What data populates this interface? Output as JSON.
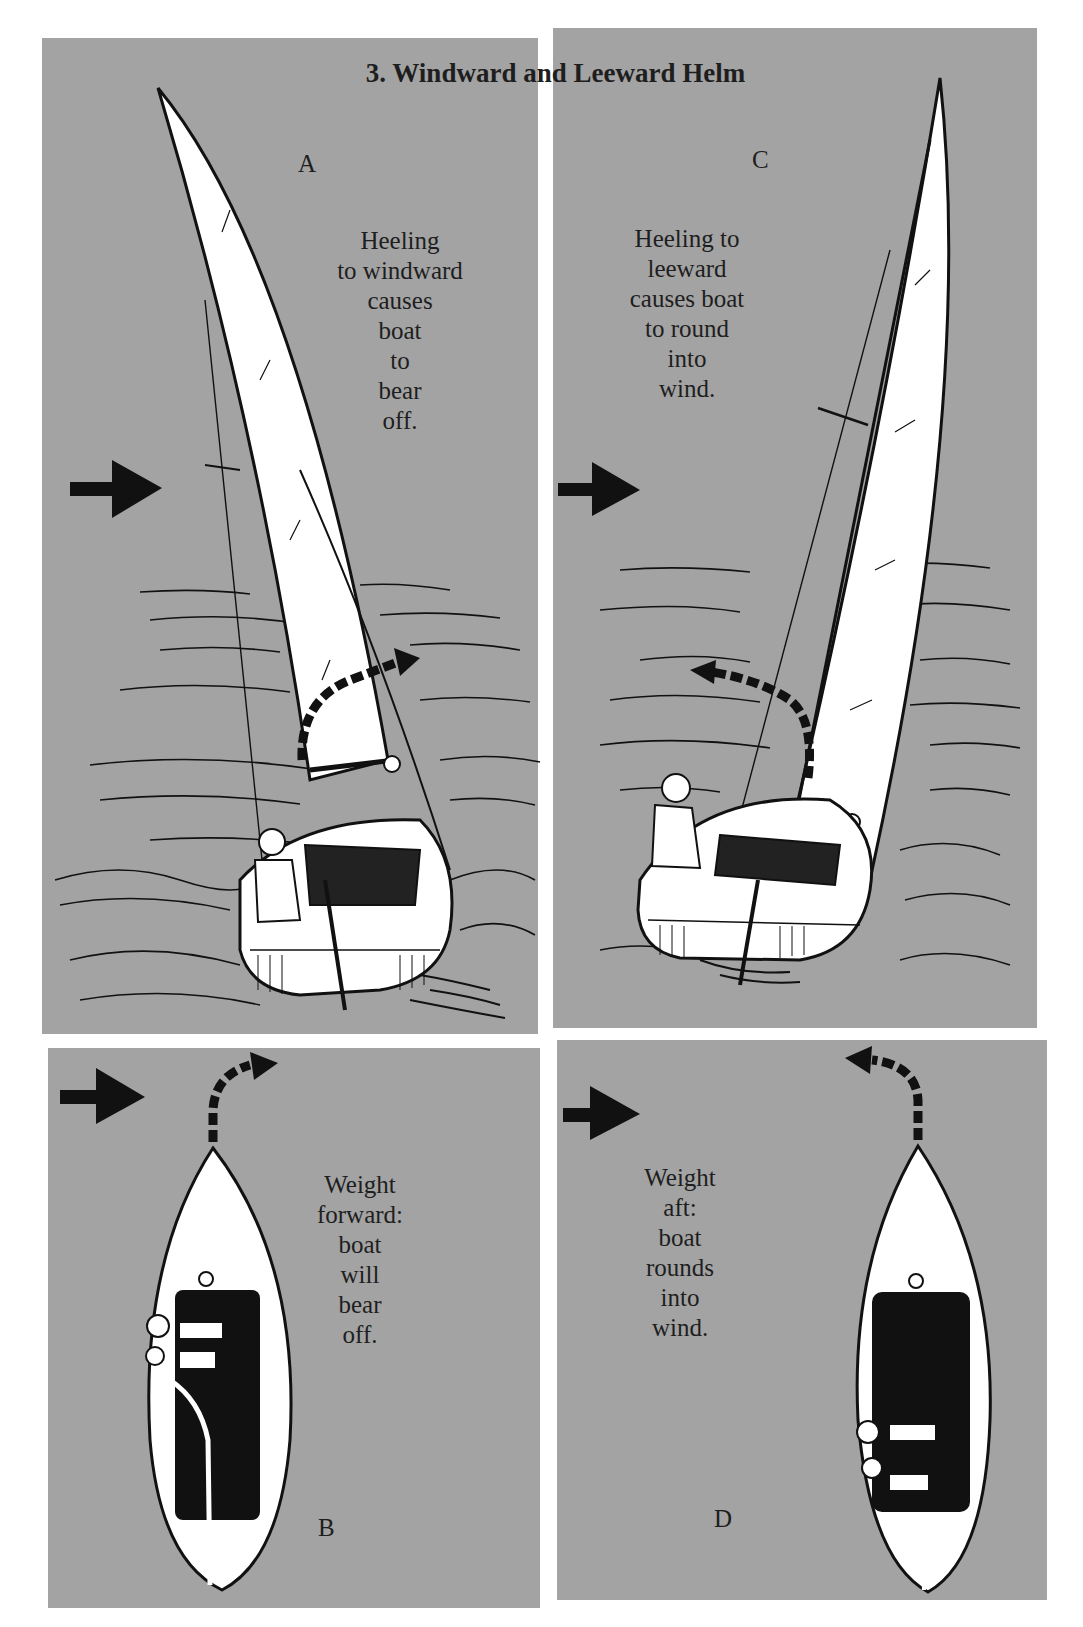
{
  "figure": {
    "title": "3.  Windward and Leeward Helm",
    "colors": {
      "panel_background": "#a3a3a3",
      "page_background": "#ffffff",
      "ink": "#111111",
      "sail": "#ffffff"
    },
    "panels": {
      "a": {
        "label": "A",
        "caption_lines": [
          "Heeling",
          "to windward",
          "causes",
          "boat",
          "to",
          "bear",
          "off."
        ],
        "wind_arrow": "right",
        "turn_arrow": "right"
      },
      "c": {
        "label": "C",
        "caption_lines": [
          "Heeling to",
          "leeward",
          "causes boat",
          "to round",
          "into",
          "wind."
        ],
        "wind_arrow": "right",
        "turn_arrow": "left"
      },
      "b": {
        "label": "B",
        "caption_lines": [
          "Weight",
          "forward:",
          "boat",
          "will",
          "bear",
          "off."
        ],
        "wind_arrow": "right",
        "turn_arrow": "right"
      },
      "d": {
        "label": "D",
        "caption_lines": [
          "Weight",
          "aft:",
          "boat",
          "rounds",
          "into",
          "wind."
        ],
        "wind_arrow": "right",
        "turn_arrow": "left"
      }
    }
  }
}
